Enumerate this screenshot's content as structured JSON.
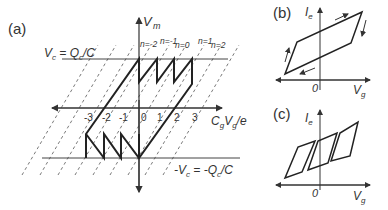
{
  "panels": {
    "a": {
      "label": "(a)",
      "y_axis": "V",
      "y_axis_sub": "m",
      "x_axis": "C",
      "x_axis_sub1": "g",
      "x_axis_mid": "V",
      "x_axis_sub2": "g",
      "x_axis_tail": "/e",
      "upper_line": "V_c = Q_c/C",
      "lower_line": "-V_c = -Q_c/C",
      "n_labels": [
        "n=-2",
        "n=-1",
        "n=0",
        "n=1",
        "n=2"
      ],
      "ticks": [
        "-3",
        "-2",
        "-1",
        "0",
        "1",
        "2",
        "3"
      ]
    },
    "b": {
      "label": "(b)",
      "y_axis": "I_e",
      "x_axis": "V_g",
      "origin": "0"
    },
    "c": {
      "label": "(c)",
      "y_axis": "I_e",
      "x_axis": "V_g",
      "origin": "0"
    }
  }
}
